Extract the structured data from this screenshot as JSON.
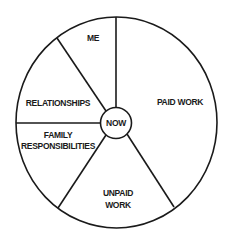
{
  "diagram": {
    "type": "life-wheel",
    "center": {
      "label": "NOW"
    },
    "segments": [
      {
        "id": "me",
        "lines": [
          "ME"
        ]
      },
      {
        "id": "paid-work",
        "lines": [
          "PAID WORK"
        ]
      },
      {
        "id": "unpaid-work",
        "lines": [
          "UNPAID",
          "WORK"
        ]
      },
      {
        "id": "family-responsibilities",
        "lines": [
          "FAMILY",
          "RESPONSIBILITIES"
        ]
      },
      {
        "id": "relationships",
        "lines": [
          "RELATIONSHIPS"
        ]
      }
    ],
    "colors": {
      "stroke": "#1a1a1a",
      "background": "#ffffff",
      "text": "#1a1a1a"
    }
  }
}
